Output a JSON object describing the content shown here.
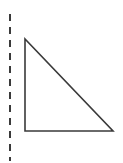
{
  "canvas": {
    "width": 123,
    "height": 163,
    "background_color": "#ffffff"
  },
  "figure": {
    "stroke_color": "#3a3a3a",
    "fill_color": "none"
  },
  "shapes": {
    "dashed_line": {
      "name": "dashed vertical line",
      "x": 10,
      "y_start": 14,
      "y_end": 161,
      "stroke_width": 2,
      "stroke_color": "#3a3a3a",
      "dash_length": 7,
      "gap_length": 6,
      "points": "10,14 10,161"
    },
    "triangle": {
      "name": "right triangle",
      "stroke_width": 1.6,
      "stroke_color": "#3a3a3a",
      "fill": "none",
      "vertices": [
        {
          "label": "apex",
          "x": 25,
          "y": 39
        },
        {
          "label": "right-angle",
          "x": 25,
          "y": 131
        },
        {
          "label": "base-right",
          "x": 113,
          "y": 131
        }
      ],
      "points": "25,39 25,131 113,131",
      "legs": {
        "vertical_length": 92,
        "horizontal_length": 88
      }
    }
  }
}
